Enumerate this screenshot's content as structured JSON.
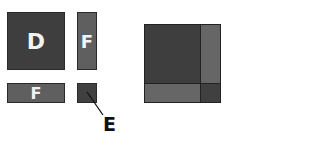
{
  "diagram": {
    "pieces": [
      {
        "id": "D",
        "label": "D",
        "shape": "large square",
        "color": "#3e3e3e"
      },
      {
        "id": "F-vertical",
        "label": "F",
        "shape": "tall rectangle",
        "color": "#5f5f5f"
      },
      {
        "id": "F-horizontal",
        "label": "F",
        "shape": "wide rectangle",
        "color": "#5f5f5f"
      },
      {
        "id": "E",
        "label": "",
        "shape": "small square",
        "color": "#404040"
      }
    ],
    "callout": {
      "label": "E",
      "points_to": "small square"
    },
    "assembled": {
      "description": "combined square: D top-left, F right, F bottom, E bottom-right corner"
    }
  }
}
